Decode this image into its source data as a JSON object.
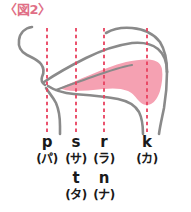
{
  "figure": {
    "title": "〈図2〉",
    "title_color": "#e06f86",
    "description_type": "sagittal cross-section of the oral cavity showing tongue position for Japanese consonant articulation points"
  },
  "colors": {
    "tongue_fill": "#f5a1b2",
    "outline_gray": "#8a8a8a",
    "dashed_line": "#e8425f",
    "text": "#1a1a1a",
    "background": "#ffffff"
  },
  "articulation_columns": [
    {
      "x": 47,
      "romaji": "p",
      "kana": "(パ)",
      "romaji2": "",
      "kana2": "",
      "place": "bilabial"
    },
    {
      "x": 76,
      "romaji": "s",
      "kana": "(サ)",
      "romaji2": "t",
      "kana2": "(タ)",
      "place": "alveolar"
    },
    {
      "x": 104,
      "romaji": "r",
      "kana": "(ラ)",
      "romaji2": "n",
      "kana2": "(ナ)",
      "place": "post-alveolar"
    },
    {
      "x": 147,
      "romaji": "k",
      "kana": "(カ)",
      "romaji2": "",
      "kana2": "",
      "place": "velar"
    }
  ],
  "guide_lines": {
    "top": 28,
    "bottom": 134,
    "count": 4
  }
}
